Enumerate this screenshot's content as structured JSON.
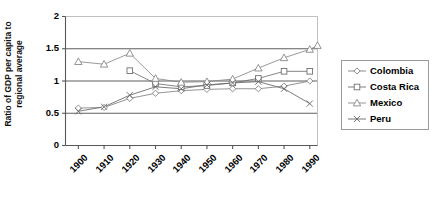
{
  "chart_data": {
    "type": "line",
    "title": "",
    "subtitle": "",
    "xlabel": "",
    "ylabel": "Ratio of GDP per capita to\nregional average",
    "x": [
      1900,
      1910,
      1920,
      1930,
      1940,
      1950,
      1960,
      1970,
      1980,
      1990
    ],
    "xtick_labels": [
      "1900",
      "1910",
      "1920",
      "1930",
      "1940",
      "1950",
      "1960",
      "1970",
      "1980",
      "1990"
    ],
    "ytick_labels": [
      "0",
      "0.5",
      "1",
      "1.5",
      "2"
    ],
    "ytick_values": [
      0,
      0.5,
      1,
      1.5,
      2
    ],
    "xlim": [
      1895,
      1993
    ],
    "ylim": [
      0,
      2
    ],
    "grid": "horizontal",
    "legend_position": "right",
    "series": [
      {
        "name": "Colombia",
        "marker": "diamond",
        "color": "#808080",
        "x": [
          1900,
          1910,
          1920,
          1930,
          1940,
          1950,
          1960,
          1970,
          1980,
          1990
        ],
        "values": [
          0.58,
          0.59,
          0.73,
          0.81,
          0.85,
          0.87,
          0.88,
          0.88,
          0.92,
          1.0
        ]
      },
      {
        "name": "Costa Rica",
        "marker": "square",
        "color": "#707070",
        "x": [
          1920,
          1930,
          1940,
          1950,
          1960,
          1970,
          1980,
          1990
        ],
        "values": [
          1.16,
          0.96,
          0.91,
          0.93,
          0.97,
          1.04,
          1.15,
          1.15
        ]
      },
      {
        "name": "Mexico",
        "marker": "triangle",
        "color": "#888888",
        "x": [
          1900,
          1910,
          1920,
          1930,
          1940,
          1950,
          1960,
          1970,
          1980,
          1990
        ],
        "values": [
          1.3,
          1.26,
          1.43,
          1.04,
          0.98,
          0.99,
          1.03,
          1.2,
          1.36,
          1.49
        ]
      },
      {
        "name": "Peru",
        "marker": "cross",
        "color": "#666666",
        "x": [
          1900,
          1910,
          1920,
          1930,
          1940,
          1950,
          1960,
          1970,
          1980,
          1990
        ],
        "values": [
          0.53,
          0.6,
          0.78,
          0.91,
          0.88,
          0.94,
          0.97,
          0.99,
          0.88,
          0.65
        ]
      }
    ],
    "mexico_endpoint": 1.55,
    "legend_entries": [
      "Colombia",
      "Costa Rica",
      "Mexico",
      "Peru"
    ]
  },
  "legend": {
    "items": [
      {
        "label": "Colombia",
        "marker": "diamond-marker-icon"
      },
      {
        "label": "Costa Rica",
        "marker": "square-marker-icon"
      },
      {
        "label": "Mexico",
        "marker": "triangle-marker-icon"
      },
      {
        "label": "Peru",
        "marker": "cross-marker-icon"
      }
    ]
  },
  "axes": {
    "y_title": "Ratio of GDP per capita to regional average",
    "y_title_line1": "Ratio of GDP per capita to",
    "y_title_line2": "regional average"
  }
}
